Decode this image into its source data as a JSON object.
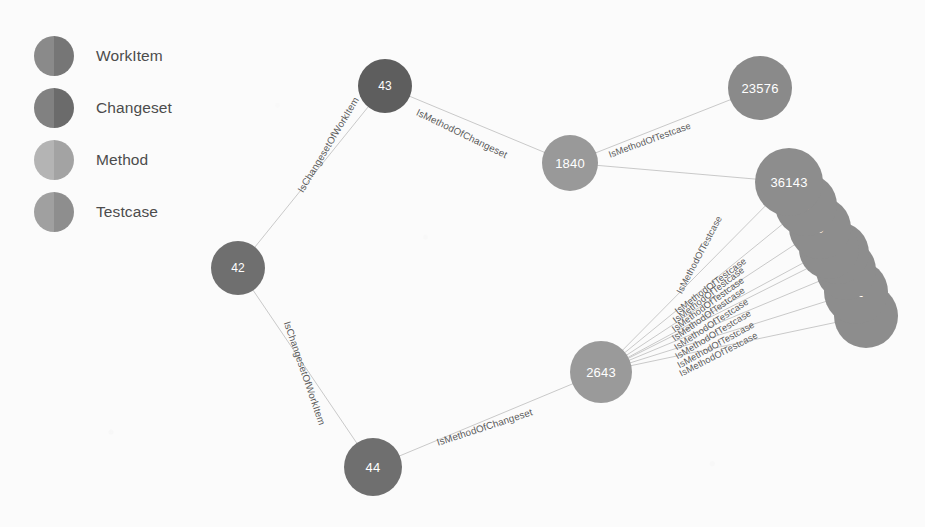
{
  "canvas": {
    "width": 925,
    "height": 527,
    "background": "#fbfbfb",
    "edge_color": "#c9c9c9"
  },
  "legend": {
    "title": "",
    "items": [
      {
        "label": "WorkItem",
        "color": "#767676",
        "color_left": "#8a8a8a"
      },
      {
        "label": "Changeset",
        "color": "#6b6b6b",
        "color_left": "#818181"
      },
      {
        "label": "Method",
        "color": "#a3a3a3",
        "color_left": "#b4b4b4"
      },
      {
        "label": "Testcase",
        "color": "#8e8e8e",
        "color_left": "#a0a0a0"
      }
    ]
  },
  "graph": {
    "nodes": [
      {
        "id": "n42",
        "label": "42",
        "type": "WorkItem",
        "x": 238,
        "y": 268,
        "r": 27,
        "color": "#6f6f6f"
      },
      {
        "id": "n43",
        "label": "43",
        "type": "Changeset",
        "x": 385,
        "y": 86,
        "r": 27,
        "color": "#5e5e5e"
      },
      {
        "id": "n44",
        "label": "44",
        "type": "WorkItem",
        "x": 373,
        "y": 467,
        "r": 29,
        "color": "#6f6f6f"
      },
      {
        "id": "n1840",
        "label": "1840",
        "type": "Method",
        "x": 570,
        "y": 163,
        "r": 28,
        "color": "#999999"
      },
      {
        "id": "n2643",
        "label": "2643",
        "type": "Method",
        "x": 601,
        "y": 372,
        "r": 31,
        "color": "#9a9a9a"
      },
      {
        "id": "n23576",
        "label": "23576",
        "type": "Testcase",
        "x": 760,
        "y": 88,
        "r": 32,
        "color": "#8a8a8a"
      },
      {
        "id": "n36143",
        "label": "36143",
        "type": "Testcase",
        "x": 789,
        "y": 182,
        "r": 34,
        "color": "#8d8d8d"
      },
      {
        "id": "c2",
        "label": "5",
        "type": "Testcase",
        "x": 806,
        "y": 205,
        "r": 31,
        "color": "#8d8d8d"
      },
      {
        "id": "c3",
        "label": "5",
        "type": "Testcase",
        "x": 820,
        "y": 228,
        "r": 31,
        "color": "#8d8d8d"
      },
      {
        "id": "c4",
        "label": "5",
        "type": "Testcase",
        "x": 829,
        "y": 249,
        "r": 30,
        "color": "#8d8d8d"
      },
      {
        "id": "c5",
        "label": "40",
        "type": "Testcase",
        "x": 838,
        "y": 253,
        "r": 31,
        "color": "#8d8d8d"
      },
      {
        "id": "c6",
        "label": "5",
        "type": "Testcase",
        "x": 846,
        "y": 270,
        "r": 30,
        "color": "#8d8d8d"
      },
      {
        "id": "c7",
        "label": "51",
        "type": "Testcase",
        "x": 856,
        "y": 292,
        "r": 32,
        "color": "#8d8d8d"
      },
      {
        "id": "c8",
        "label": "3",
        "type": "Testcase",
        "x": 866,
        "y": 316,
        "r": 32,
        "color": "#8d8d8d"
      }
    ],
    "edges": [
      {
        "from": "n43",
        "to": "n42",
        "label": "IsChangesetOfWorkItem",
        "label_x": 300,
        "label_y": 186,
        "angle": -59
      },
      {
        "from": "n42",
        "to": "n44",
        "label": "IsChangesetOfWorkItem",
        "label_x": 287,
        "label_y": 316,
        "angle": 71
      },
      {
        "from": "n43",
        "to": "n1840",
        "label": "IsMethodOfChangeset",
        "label_x": 417,
        "label_y": 106,
        "angle": 26
      },
      {
        "from": "n44",
        "to": "n2643",
        "label": "IsMethodOfChangeset",
        "label_x": 437,
        "label_y": 437,
        "angle": -18
      },
      {
        "from": "n1840",
        "to": "n23576",
        "label": "IsMethodOfTestcase",
        "label_x": 609,
        "label_y": 150,
        "angle": -20
      },
      {
        "from": "n1840",
        "to": "n36143",
        "label": "IsMethodOfTestcase",
        "label_x": 679,
        "label_y": 288,
        "angle": -62
      },
      {
        "from": "n2643",
        "to": "n36143",
        "label": "IsMethodOfTestcase",
        "label_x": 676,
        "label_y": 307,
        "angle": -37
      },
      {
        "from": "n2643",
        "to": "c2",
        "label": "IsMethodOfTestcase",
        "label_x": 674,
        "label_y": 316,
        "angle": -37
      },
      {
        "from": "n2643",
        "to": "c3",
        "label": "IsMethodOfTestcase",
        "label_x": 673,
        "label_y": 325,
        "angle": -36
      },
      {
        "from": "n2643",
        "to": "c4",
        "label": "IsMethodOfTestcase",
        "label_x": 673,
        "label_y": 334,
        "angle": -35
      },
      {
        "from": "n2643",
        "to": "c5",
        "label": "IsMethodOfTestcase",
        "label_x": 675,
        "label_y": 343,
        "angle": -33
      },
      {
        "from": "n2643",
        "to": "c6",
        "label": "IsMethodOfTestcase",
        "label_x": 676,
        "label_y": 352,
        "angle": -31
      },
      {
        "from": "n2643",
        "to": "c7",
        "label": "IsMethodOfTestcase",
        "label_x": 678,
        "label_y": 361,
        "angle": -29
      },
      {
        "from": "n2643",
        "to": "c8",
        "label": "IsMethodOfTestcase",
        "label_x": 680,
        "label_y": 369,
        "angle": -27
      }
    ]
  }
}
